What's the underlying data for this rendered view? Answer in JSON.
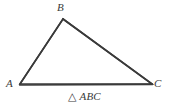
{
  "figure": {
    "caption_symbol": "△",
    "caption_name": "ABC",
    "stroke_color": "#3a3a3a",
    "background_color": "#ffffff",
    "stroke_width": 1.6,
    "vertices": [
      {
        "id": "A",
        "label": "A",
        "x": 20,
        "y": 84
      },
      {
        "id": "B",
        "label": "B",
        "x": 63,
        "y": 19
      },
      {
        "id": "C",
        "label": "C",
        "x": 152,
        "y": 84
      }
    ],
    "edges": [
      {
        "id": "AB",
        "from": "A",
        "to": "B"
      },
      {
        "id": "BC",
        "from": "B",
        "to": "C"
      },
      {
        "id": "CA",
        "from": "C",
        "to": "A"
      }
    ]
  }
}
